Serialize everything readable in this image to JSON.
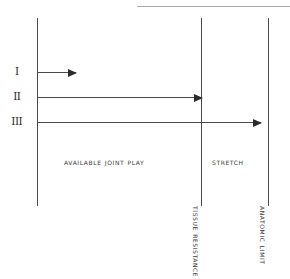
{
  "diagram": {
    "type": "range-diagram",
    "background_color": "#ffffff",
    "ink_color": "#3a3a3a",
    "line_color": "#4a4a4a",
    "arrowhead_color": "#2b2b2b"
  },
  "boundaries": [
    {
      "id": "start",
      "label": "",
      "orientation": "vertical",
      "x": 37
    },
    {
      "id": "tissue",
      "label": "Tissue Resistance",
      "orientation": "vertical",
      "x": 201
    },
    {
      "id": "anatomic-limit",
      "label": "Anatomic Limit",
      "orientation": "vertical",
      "x": 268
    }
  ],
  "zones": [
    {
      "id": "available-joint-play",
      "label": "Available  Joint  Play",
      "from": "start",
      "to": "tissue"
    },
    {
      "id": "stretch",
      "label": "Stretch",
      "from": "tissue",
      "to": "anatomic-limit"
    }
  ],
  "grades": [
    {
      "id": "grade-1",
      "numeral": "I",
      "ends_at": "within-available-joint-play"
    },
    {
      "id": "grade-2",
      "numeral": "II",
      "ends_at": "tissue-resistance"
    },
    {
      "id": "grade-3",
      "numeral": "III",
      "ends_at": "anatomic-limit"
    }
  ],
  "chart_data": {
    "type": "bar",
    "xlabel": "",
    "ylabel": "",
    "categories": [
      "I",
      "II",
      "III"
    ],
    "values": [
      39,
      165,
      224
    ],
    "xlim": [
      0,
      253
    ],
    "grid": false,
    "annotations": [
      "Available  Joint  Play",
      "Stretch",
      "Tissue Resistance",
      "Anatomic Limit"
    ]
  }
}
